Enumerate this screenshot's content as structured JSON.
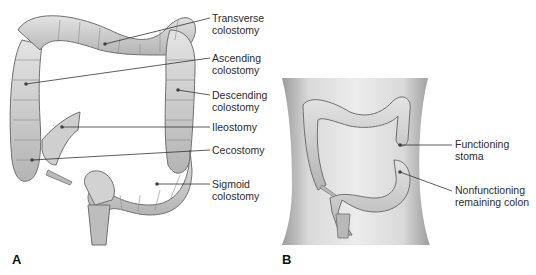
{
  "panel_a": {
    "letter": "A",
    "labels": [
      {
        "id": "transverse",
        "text": "Transverse\ncolostomy"
      },
      {
        "id": "ascending",
        "text": "Ascending\ncolostomy"
      },
      {
        "id": "descending",
        "text": "Descending\ncolostomy"
      },
      {
        "id": "ileostomy",
        "text": "Ileostomy"
      },
      {
        "id": "cecostomy",
        "text": "Cecostomy"
      },
      {
        "id": "sigmoid",
        "text": "Sigmoid\ncolostomy"
      }
    ]
  },
  "panel_b": {
    "letter": "B",
    "labels": [
      {
        "id": "functioning",
        "text": "Functioning\nstoma"
      },
      {
        "id": "nonfunctioning",
        "text": "Nonfunctioning\nremaining colon"
      }
    ]
  },
  "colors": {
    "colon_fill": "#c9c9c9",
    "colon_stroke": "#6f6f6f",
    "colon_highlight": "#e6e6e6",
    "torso_fill": "#dcdcdc",
    "leader_line": "#333333"
  }
}
